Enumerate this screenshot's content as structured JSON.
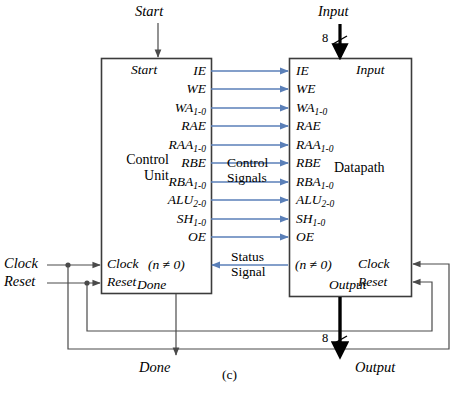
{
  "figure": {
    "caption": "(c)",
    "blocks": {
      "control_unit": {
        "name_line1": "Control",
        "name_line2": "Unit",
        "ports_top": "Start",
        "ports_bottom": "Done",
        "clock_port": "Clock",
        "reset_port": "Reset",
        "status_port": "(n ≠ 0)",
        "control_outputs": [
          {
            "base": "IE",
            "sub": ""
          },
          {
            "base": "WE",
            "sub": ""
          },
          {
            "base": "WA",
            "sub": "1-0"
          },
          {
            "base": "RAE",
            "sub": ""
          },
          {
            "base": "RAA",
            "sub": "1-0"
          },
          {
            "base": "RBE",
            "sub": ""
          },
          {
            "base": "RBA",
            "sub": "1-0"
          },
          {
            "base": "ALU",
            "sub": "2-0"
          },
          {
            "base": "SH",
            "sub": "1-0"
          },
          {
            "base": "OE",
            "sub": ""
          }
        ]
      },
      "datapath": {
        "name": "Datapath",
        "ports_top": "Input",
        "ports_bottom": "Output",
        "clock_port": "Clock",
        "reset_port": "Reset",
        "status_port": "(n ≠ 0)",
        "control_inputs": [
          {
            "base": "IE",
            "sub": ""
          },
          {
            "base": "WE",
            "sub": ""
          },
          {
            "base": "WA",
            "sub": "1-0"
          },
          {
            "base": "RAE",
            "sub": ""
          },
          {
            "base": "RAA",
            "sub": "1-0"
          },
          {
            "base": "RBE",
            "sub": ""
          },
          {
            "base": "RBA",
            "sub": "1-0"
          },
          {
            "base": "ALU",
            "sub": "2-0"
          },
          {
            "base": "SH",
            "sub": "1-0"
          },
          {
            "base": "OE",
            "sub": ""
          }
        ]
      }
    },
    "nets": {
      "control_signals_line1": "Control",
      "control_signals_line2": "Signals",
      "status_signal_line1": "Status",
      "status_signal_line2": "Signal"
    },
    "external": {
      "start": "Start",
      "input": "Input",
      "clock": "Clock",
      "reset": "Reset",
      "done": "Done",
      "output": "Output",
      "input_bus_width": "8",
      "output_bus_width": "8"
    },
    "colors": {
      "signal_blue": "#5a7fb8",
      "wire_black": "#4a4a4a",
      "box_stroke": "#3c3c3c",
      "bus_black": "#000000"
    }
  }
}
